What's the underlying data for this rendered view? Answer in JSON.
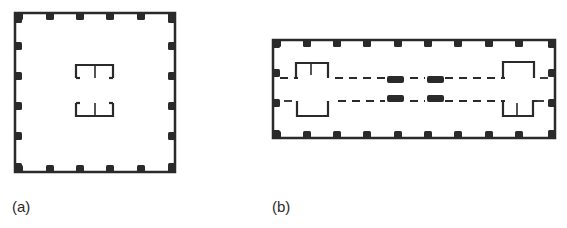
{
  "figure": {
    "panels": [
      {
        "id": "a",
        "label": "(a)",
        "description": "square plan with perimeter columns and central core walls",
        "outline": {
          "x": 15,
          "y": 13,
          "w": 160,
          "h": 159
        },
        "columns_top_x": [
          19,
          50,
          80,
          110,
          141,
          172
        ],
        "columns_side_y": [
          19,
          46,
          76,
          106,
          136,
          167
        ]
      },
      {
        "id": "b",
        "label": "(b)",
        "description": "rectangular plan with perimeter columns, corridor with dashed lines, interior columns and end core walls",
        "outline": {
          "x": 273,
          "y": 40,
          "w": 282,
          "h": 98
        },
        "columns_top_x": [
          277,
          307,
          337,
          367,
          398,
          428,
          458,
          489,
          519,
          552
        ],
        "columns_side_y": [
          44,
          73,
          103,
          134
        ]
      }
    ],
    "colors": {
      "ink": "#2a2a2a",
      "background": "#ffffff"
    }
  }
}
